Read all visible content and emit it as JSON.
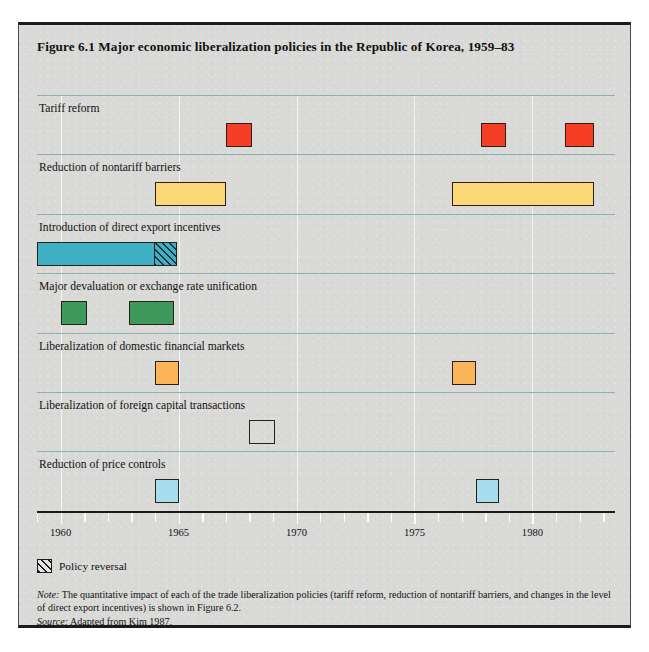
{
  "figure": {
    "title": "Figure 6.1  Major economic liberalization policies in the Republic of Korea, 1959–83"
  },
  "legend": {
    "swatch_name": "hatched-swatch",
    "label": "Policy reversal"
  },
  "notes": {
    "note_prefix": "Note:",
    "note_text": " The quantitative impact of each of the trade liberalization policies (tariff reform, reduction of nontariff barriers, and changes in the level of direct export incentives) is shown in Figure 6.2.",
    "source_prefix": "Source:",
    "source_text": " Adapted from Kim 1987."
  },
  "chart_data": {
    "type": "bar",
    "title": "Figure 6.1  Major economic liberalization policies in the Republic of Korea, 1959–83",
    "xlabel": "",
    "ylabel": "",
    "xlim": [
      1959,
      1983.5
    ],
    "grid": true,
    "legend_position": "below-axis-left",
    "orientation": "horizontal-timeline",
    "tick_labels": [
      "1960",
      "1965",
      "1970",
      "1975",
      "1980"
    ],
    "tick_values": [
      1960,
      1965,
      1970,
      1975,
      1980
    ],
    "minor_tick_values": [
      1959,
      1961,
      1962,
      1963,
      1964,
      1966,
      1967,
      1968,
      1969,
      1971,
      1972,
      1973,
      1974,
      1976,
      1977,
      1978,
      1979,
      1981,
      1982,
      1983
    ],
    "categories": [
      "Tariff reform",
      "Reduction of nontariff barriers",
      "Introduction of direct export incentives",
      "Major devaluation or exchange rate unification",
      "Liberalization of domestic financial markets",
      "Liberalization of foreign capital transactions",
      "Reduction of price controls"
    ],
    "series": [
      {
        "name": "Tariff reform",
        "color": "#f63d25",
        "bars": [
          {
            "start": 1967.0,
            "end": 1968.1,
            "reversal": false
          },
          {
            "start": 1977.8,
            "end": 1978.9,
            "reversal": false
          },
          {
            "start": 1981.4,
            "end": 1982.6,
            "reversal": false
          }
        ]
      },
      {
        "name": "Reduction of nontariff barriers",
        "color": "#fcd775",
        "bars": [
          {
            "start": 1964.0,
            "end": 1967.0,
            "reversal": false
          },
          {
            "start": 1976.6,
            "end": 1982.6,
            "reversal": false
          }
        ]
      },
      {
        "name": "Introduction of direct export incentives",
        "color": "#3fb0c4",
        "bars": [
          {
            "start": 1959.0,
            "end": 1964.0,
            "reversal": false
          },
          {
            "start": 1964.0,
            "end": 1964.95,
            "reversal": true
          }
        ]
      },
      {
        "name": "Major devaluation or exchange rate unification",
        "color": "#3e9a5c",
        "bars": [
          {
            "start": 1960.0,
            "end": 1961.1,
            "reversal": false
          },
          {
            "start": 1962.9,
            "end": 1964.8,
            "reversal": false
          }
        ]
      },
      {
        "name": "Liberalization of domestic financial markets",
        "color": "#fbb558",
        "bars": [
          {
            "start": 1964.0,
            "end": 1965.0,
            "reversal": false
          },
          {
            "start": 1976.6,
            "end": 1977.6,
            "reversal": false
          }
        ]
      },
      {
        "name": "Liberalization of foreign capital transactions",
        "color": "#9bc košt",
        "bars": [
          {
            "start": 1968.0,
            "end": 1969.1,
            "reversal": false
          }
        ]
      },
      {
        "name": "Reduction of price controls",
        "color": "#a6dcee",
        "bars": [
          {
            "start": 1964.0,
            "end": 1965.0,
            "reversal": false
          },
          {
            "start": 1977.6,
            "end": 1978.6,
            "reversal": false
          }
        ]
      }
    ]
  }
}
